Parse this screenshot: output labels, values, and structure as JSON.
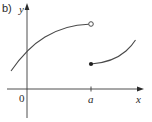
{
  "figure": {
    "part_label": "b)",
    "axes": {
      "x_label": "x",
      "y_label": "y",
      "origin_label": "0",
      "tick_label": "a"
    },
    "pieces": [
      {
        "name": "left-branch",
        "description": "increasing concave-down curve approaching x=a from the left",
        "endpoint": "open circle at x=a"
      },
      {
        "name": "right-branch",
        "description": "increasing concave-up curve starting at x=a",
        "endpoint": "filled dot at x=a"
      }
    ],
    "colors": {
      "curve": "#4a4a4a",
      "axis": "#3a3a3a",
      "text": "#2a2a2a"
    }
  }
}
